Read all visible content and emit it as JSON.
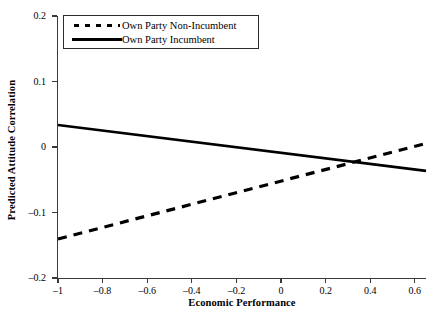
{
  "chart_data": {
    "type": "line",
    "title": "",
    "xlabel": "Economic Performance",
    "ylabel": "Predicted Attitude Correlation",
    "xlim": [
      -1.0,
      0.65
    ],
    "ylim": [
      -0.2,
      0.2
    ],
    "xticks": [
      -1,
      -0.8,
      -0.6,
      -0.4,
      -0.2,
      0,
      0.2,
      0.4,
      0.6
    ],
    "xticklabels": [
      "–1",
      "–0.8",
      "–0.6",
      "–0.4",
      "–0.2",
      "0",
      "0.2",
      "0.4",
      "0.6"
    ],
    "yticks": [
      0.2,
      0.1,
      0,
      -0.1,
      -0.2
    ],
    "yticklabels": [
      "0.2",
      "0.1",
      "0",
      "–0.1",
      "–0.2"
    ],
    "grid": false,
    "legend_position": "upper left",
    "series": [
      {
        "name": "Own Party Non-Incumbent",
        "style": "dashed",
        "color": "#000000",
        "x": [
          -1.0,
          0.65
        ],
        "y": [
          -0.1405,
          0.0055
        ]
      },
      {
        "name": "Own Party Incumbent",
        "style": "solid",
        "color": "#000000",
        "x": [
          -1.0,
          0.65
        ],
        "y": [
          0.0335,
          -0.0365
        ]
      }
    ],
    "crossing_point": {
      "x": 0.37,
      "y": -0.0285
    }
  },
  "legend": {
    "items": [
      {
        "label": "Own Party Non-Incumbent",
        "key": "dashed-line-key"
      },
      {
        "label": "Own Party Incumbent",
        "key": "solid-line-key"
      }
    ]
  }
}
